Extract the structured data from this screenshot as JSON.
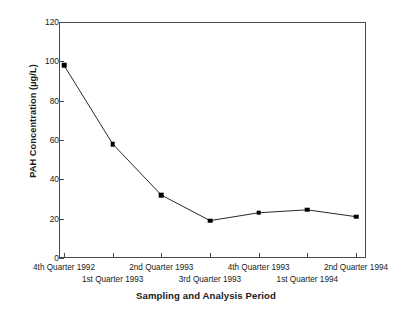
{
  "chart_data": {
    "type": "line",
    "title": "",
    "xlabel": "Sampling and Analysis Period",
    "ylabel": "PAH Concentration (µg/L)",
    "categories": [
      "4th Quarter 1992",
      "1st Quarter 1993",
      "2nd Quarter 1993",
      "3rd Quarter 1993",
      "4th Quarter 1993",
      "1st Quarter 1994",
      "2nd Quarter 1994"
    ],
    "values": [
      98,
      58,
      32,
      19,
      23,
      24.5,
      21
    ],
    "ylim": [
      0,
      120
    ],
    "yticks": [
      0,
      20,
      40,
      60,
      80,
      100,
      120
    ],
    "ytick_labels": [
      "0",
      "20",
      "40",
      "60",
      "80",
      "100",
      "120"
    ],
    "grid": false,
    "legend": false,
    "marker": "filled-square",
    "line_color": "#2a2a2a",
    "marker_color": "#000000",
    "frame_color": "#4a4a4a"
  },
  "axes": {
    "y_title": "PAH Concentration (µg/L)",
    "x_title": "Sampling and Analysis Period"
  },
  "x_labels_top_row": [
    "4th Quarter 1992",
    "2nd Quarter 1993",
    "4th Quarter 1993",
    "2nd Quarter 1994"
  ],
  "x_labels_bottom_row": [
    "1st Quarter 1993",
    "3rd Quarter 1993",
    "1st Quarter 1994"
  ]
}
